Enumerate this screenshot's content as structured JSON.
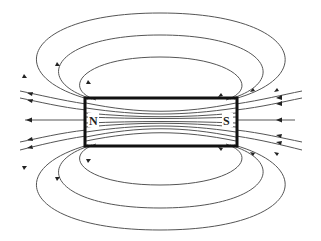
{
  "diagram": {
    "magnet": {
      "north_label": "N",
      "south_label": "S",
      "x": 85,
      "y": 98,
      "width": 152,
      "height": 48
    },
    "colors": {
      "field_line": "#555555",
      "magnet_outline": "#111111",
      "arrowhead": "#222222",
      "background": "#ffffff"
    },
    "loops_above": 3,
    "loops_below": 3,
    "open_lines_each_side": 5,
    "arrow_direction": "right-to-left (S pole side toward N pole side outside magnet; lines exit left)"
  }
}
